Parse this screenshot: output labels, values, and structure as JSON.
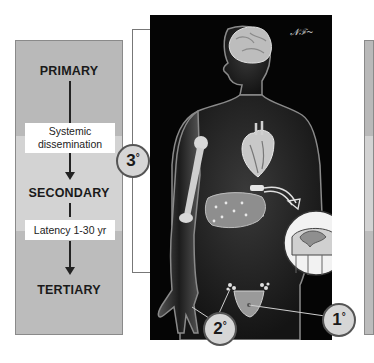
{
  "stages": {
    "primary": "PRIMARY",
    "secondary": "SECONDARY",
    "tertiary": "TERTIARY"
  },
  "transitions": {
    "primary_to_secondary": "Systemic dissemination",
    "primary_to_secondary_lines": [
      "Systemic",
      "dissemination"
    ],
    "secondary_to_tertiary": "Latency 1-30 yr"
  },
  "badges": {
    "primary": {
      "number": "1",
      "degree": "°",
      "site": "genital chancre"
    },
    "secondary": {
      "number": "2",
      "degree": "°",
      "site": "palms and lymph nodes"
    },
    "tertiary": {
      "number": "3",
      "degree": "°",
      "site": "brain, heart, bone, liver, spinal cord"
    }
  },
  "illustration": {
    "subject": "human figure with organs highlighted",
    "organs": [
      "brain",
      "heart",
      "humerus bone",
      "liver",
      "vertebrae",
      "spinal cord cross-section",
      "inguinal lymph nodes",
      "genitals",
      "hand/palm"
    ],
    "signature": "artist signature"
  },
  "colors": {
    "band_primary": "#b9b9b9",
    "band_secondary": "#d3d3d3",
    "band_tertiary": "#bcbcbc",
    "panel_background": "#050505",
    "badge_fill": "#d6d6d6"
  }
}
